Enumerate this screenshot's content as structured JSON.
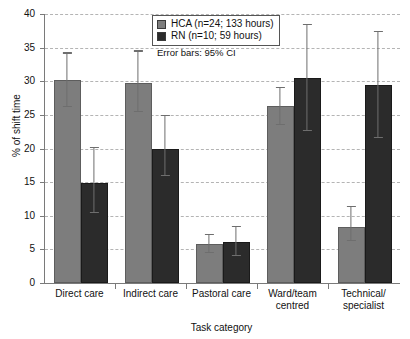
{
  "chart_data": {
    "type": "bar",
    "title": "",
    "xlabel": "Task category",
    "ylabel": "% of shift time",
    "ylim": [
      0,
      40
    ],
    "ytick_step": 5,
    "yticks": [
      0,
      5,
      10,
      15,
      20,
      25,
      30,
      35,
      40
    ],
    "grid": true,
    "legend_position": "top-center",
    "annotation": "Error bars: 95% CI",
    "categories": [
      "Direct care",
      "Indirect care",
      "Pastoral care",
      "Ward/team centred",
      "Technical/specialist"
    ],
    "category_lines": [
      [
        "Direct care"
      ],
      [
        "Indirect care"
      ],
      [
        "Pastoral care"
      ],
      [
        "Ward/team",
        "centred"
      ],
      [
        "Technical/",
        "specialist"
      ]
    ],
    "series": [
      {
        "name": "HCA (n=24; 133 hours)",
        "short_name": "HCA",
        "color": "#7d7d7d",
        "values": [
          30.2,
          29.8,
          5.8,
          26.3,
          8.3
        ],
        "ci_low": [
          26.2,
          25.4,
          4.5,
          23.5,
          6.2
        ],
        "ci_high": [
          34.3,
          34.6,
          7.3,
          29.2,
          11.5
        ]
      },
      {
        "name": "RN (n=10; 59 hours)",
        "short_name": "RN",
        "color": "#2b2b2b",
        "values": [
          14.9,
          20.0,
          6.1,
          30.5,
          29.4
        ],
        "ci_low": [
          10.4,
          15.9,
          4.0,
          22.6,
          21.5
        ],
        "ci_high": [
          20.3,
          25.0,
          8.5,
          38.5,
          37.5
        ]
      }
    ]
  },
  "legend": {
    "items": [
      {
        "label": "HCA (n=24; 133 hours)",
        "color": "#7d7d7d"
      },
      {
        "label": "RN (n=10; 59 hours)",
        "color": "#2b2b2b"
      }
    ]
  },
  "colors": {
    "hca": "#7d7d7d",
    "rn": "#2b2b2b",
    "axis": "#7a7a7a",
    "grid": "#b4b4b4",
    "error_bar": "#6e6e6e"
  }
}
